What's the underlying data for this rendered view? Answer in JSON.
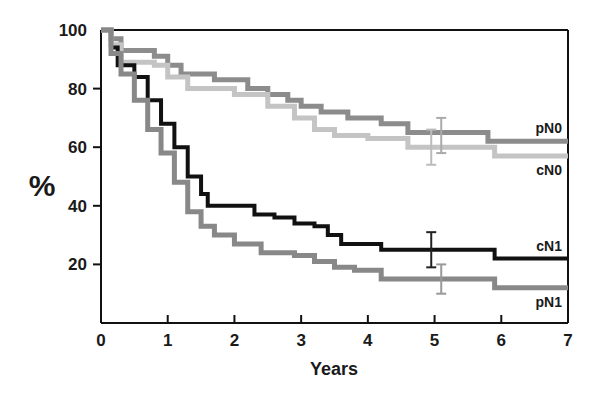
{
  "chart_data": {
    "type": "line",
    "subtype": "kaplan-meier step curves",
    "title": "",
    "xlabel": "Years",
    "ylabel": "%",
    "xlim": [
      0,
      7
    ],
    "ylim": [
      0,
      100
    ],
    "xticks": [
      0,
      1,
      2,
      3,
      4,
      5,
      6,
      7
    ],
    "yticks": [
      20,
      40,
      60,
      80,
      100
    ],
    "grid": false,
    "legend": "inline labels at right end of curves",
    "series": [
      {
        "name": "pN0",
        "color": "#8c8c8c",
        "width": 5,
        "points": [
          [
            0,
            100
          ],
          [
            0.15,
            97
          ],
          [
            0.3,
            93
          ],
          [
            0.8,
            91
          ],
          [
            1.0,
            88
          ],
          [
            1.2,
            85
          ],
          [
            1.7,
            83
          ],
          [
            2.2,
            80
          ],
          [
            2.5,
            78
          ],
          [
            2.8,
            76
          ],
          [
            3.0,
            74
          ],
          [
            3.3,
            72
          ],
          [
            3.7,
            70
          ],
          [
            4.2,
            68
          ],
          [
            4.6,
            65
          ],
          [
            5.8,
            62
          ],
          [
            7,
            62
          ]
        ],
        "error_bar": {
          "x": 5.1,
          "low": 58,
          "high": 70,
          "color": "#aaaaaa"
        }
      },
      {
        "name": "cN0",
        "color": "#c4c4c4",
        "width": 5,
        "points": [
          [
            0,
            100
          ],
          [
            0.15,
            95
          ],
          [
            0.3,
            89
          ],
          [
            0.8,
            88
          ],
          [
            1.0,
            84
          ],
          [
            1.3,
            80
          ],
          [
            2.0,
            78
          ],
          [
            2.5,
            74
          ],
          [
            2.9,
            70
          ],
          [
            3.2,
            66
          ],
          [
            3.5,
            64
          ],
          [
            4.0,
            63
          ],
          [
            4.6,
            60
          ],
          [
            5.9,
            57
          ],
          [
            7,
            57
          ]
        ],
        "error_bar": {
          "x": 4.95,
          "low": 54,
          "high": 66,
          "color": "#bbbbbb"
        }
      },
      {
        "name": "cN1",
        "color": "#111111",
        "width": 4,
        "points": [
          [
            0,
            100
          ],
          [
            0.15,
            94
          ],
          [
            0.25,
            88
          ],
          [
            0.5,
            84
          ],
          [
            0.7,
            76
          ],
          [
            0.9,
            68
          ],
          [
            1.1,
            60
          ],
          [
            1.3,
            50
          ],
          [
            1.5,
            44
          ],
          [
            1.6,
            40
          ],
          [
            2.0,
            40
          ],
          [
            2.3,
            37
          ],
          [
            2.6,
            36
          ],
          [
            2.9,
            34
          ],
          [
            3.2,
            33
          ],
          [
            3.4,
            30
          ],
          [
            3.6,
            27
          ],
          [
            4.2,
            25
          ],
          [
            5.9,
            22
          ],
          [
            7,
            22
          ]
        ],
        "error_bar": {
          "x": 4.95,
          "low": 19,
          "high": 31,
          "color": "#222222"
        }
      },
      {
        "name": "pN1",
        "color": "#888888",
        "width": 5,
        "points": [
          [
            0,
            100
          ],
          [
            0.15,
            92
          ],
          [
            0.3,
            85
          ],
          [
            0.5,
            76
          ],
          [
            0.7,
            66
          ],
          [
            0.9,
            58
          ],
          [
            1.1,
            48
          ],
          [
            1.3,
            38
          ],
          [
            1.5,
            33
          ],
          [
            1.7,
            30
          ],
          [
            2.0,
            27
          ],
          [
            2.4,
            24
          ],
          [
            2.9,
            23
          ],
          [
            3.2,
            21
          ],
          [
            3.5,
            19
          ],
          [
            3.8,
            18
          ],
          [
            4.2,
            15
          ],
          [
            5.9,
            12
          ],
          [
            7,
            12
          ]
        ],
        "error_bar": {
          "x": 5.1,
          "low": 10,
          "high": 20,
          "color": "#999999"
        }
      }
    ],
    "series_labels": [
      {
        "text": "pN0",
        "x": 7,
        "y": 62,
        "pos": "above"
      },
      {
        "text": "cN0",
        "x": 7,
        "y": 57,
        "pos": "below"
      },
      {
        "text": "cN1",
        "x": 7,
        "y": 22,
        "pos": "above"
      },
      {
        "text": "pN1",
        "x": 7,
        "y": 12,
        "pos": "below"
      }
    ]
  },
  "labels": {
    "xlabel": "Years",
    "ylabel": "%",
    "xticks": [
      "0",
      "1",
      "2",
      "3",
      "4",
      "5",
      "6",
      "7"
    ],
    "yticks": [
      "20",
      "40",
      "60",
      "80",
      "100"
    ],
    "series": [
      "pN0",
      "cN0",
      "cN1",
      "pN1"
    ]
  }
}
